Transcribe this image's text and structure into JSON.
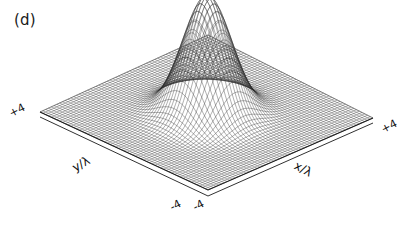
{
  "figure": {
    "panel_label": "(d)",
    "background_color": "#ffffff",
    "ink_color": "#111111"
  },
  "chart_data": {
    "type": "surface",
    "title": "(d)",
    "xlabel": "x/λ",
    "ylabel": "y/λ",
    "zlabel": "",
    "xlim": [
      -4,
      4
    ],
    "ylim": [
      -4,
      4
    ],
    "zlim": [
      0,
      1
    ],
    "x_ticks": [
      -4,
      4
    ],
    "y_ticks": [
      -4,
      4
    ],
    "x_tick_labels": [
      "-4",
      "+4"
    ],
    "y_tick_labels": [
      "-4",
      "+4"
    ],
    "grid": false,
    "legend": "none",
    "render_style": "wireframe-mesh",
    "mesh_lines_x": 60,
    "mesh_lines_y": 60,
    "surface_function": "gaussian",
    "peak_center": [
      0,
      0
    ],
    "peak_height": 1.0,
    "peak_sigma": 0.85,
    "baseline": 0.0,
    "view_azimuth_deg": -45,
    "view_elevation_deg": 28,
    "surface_z_profile": [
      {
        "r": 0.0,
        "z": 1.0
      },
      {
        "r": 0.25,
        "z": 0.96
      },
      {
        "r": 0.5,
        "z": 0.84
      },
      {
        "r": 0.75,
        "z": 0.68
      },
      {
        "r": 1.0,
        "z": 0.5
      },
      {
        "r": 1.25,
        "z": 0.34
      },
      {
        "r": 1.5,
        "z": 0.21
      },
      {
        "r": 1.75,
        "z": 0.12
      },
      {
        "r": 2.0,
        "z": 0.06
      },
      {
        "r": 2.5,
        "z": 0.015
      },
      {
        "r": 3.0,
        "z": 0.003
      },
      {
        "r": 3.5,
        "z": 0.0
      },
      {
        "r": 4.0,
        "z": 0.0
      }
    ]
  },
  "labels": {
    "tick_y_max": "+4",
    "tick_x_max": "+4",
    "tick_y_min": "-4",
    "tick_x_min": "-4",
    "axis_title_y": "y/λ",
    "axis_title_x": "x/λ"
  }
}
